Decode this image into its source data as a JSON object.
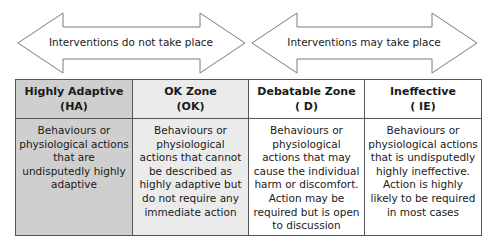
{
  "arrows": [
    {
      "label": "Interventions do not take place",
      "stroke": "#7a7a7a"
    },
    {
      "label": "Interventions may take place",
      "stroke": "#7a7a7a"
    }
  ],
  "zones": [
    {
      "title": "Highly Adaptive",
      "abbr": "(HA)",
      "description": "Behaviours or physiological actions that are undisputedly highly adaptive",
      "fill": "#cfcfcf"
    },
    {
      "title": "OK Zone",
      "abbr": "(OK)",
      "description": "Behaviours or physiological actions that cannot be described as highly adaptive but do not require any immediate action",
      "fill": "#ebebeb"
    },
    {
      "title": "Debatable Zone",
      "abbr": "( D)",
      "description": "Behaviours or physiological actions that may cause the individual harm or discomfort. Action may be required but is open to discussion",
      "fill": "#ffffff"
    },
    {
      "title": "Ineffective",
      "abbr": "( IE)",
      "description": "Behaviours or physiological actions that is undisputedly highly ineffective. Action is  highly likely to be required in most cases",
      "fill": "#ffffff"
    }
  ]
}
